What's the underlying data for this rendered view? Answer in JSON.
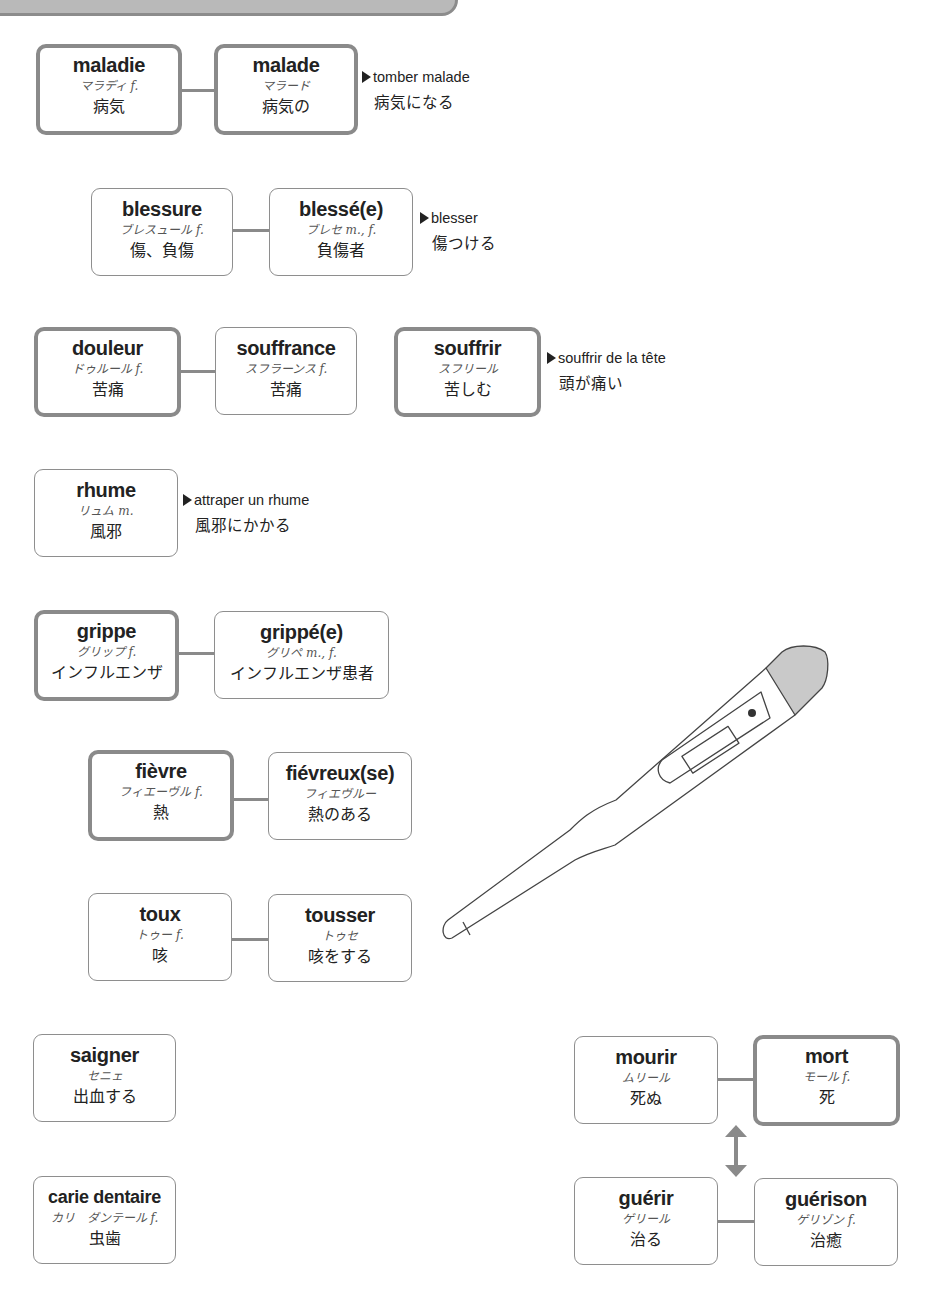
{
  "cards": {
    "maladie": {
      "fr": "maladie",
      "kana": "マラディ f.",
      "ja": "病気"
    },
    "malade": {
      "fr": "malade",
      "kana": "マラード",
      "ja": "病気の"
    },
    "blessure": {
      "fr": "blessure",
      "kana": "ブレスュール f.",
      "ja": "傷、負傷"
    },
    "blesse": {
      "fr": "blessé(e)",
      "kana": "ブレセ m., f.",
      "ja": "負傷者"
    },
    "douleur": {
      "fr": "douleur",
      "kana": "ドゥルール f.",
      "ja": "苦痛"
    },
    "souffrance": {
      "fr": "souffrance",
      "kana": "スフラーンス f.",
      "ja": "苦痛"
    },
    "souffrir": {
      "fr": "souffrir",
      "kana": "スフリール",
      "ja": "苦しむ"
    },
    "rhume": {
      "fr": "rhume",
      "kana": "リュム m.",
      "ja": "風邪"
    },
    "grippe": {
      "fr": "grippe",
      "kana": "グリップ f.",
      "ja": "インフルエンザ"
    },
    "grippe_e": {
      "fr": "grippé(e)",
      "kana": "グリペ m., f.",
      "ja": "インフルエンザ患者"
    },
    "fievre": {
      "fr": "fièvre",
      "kana": "フィエーヴル f.",
      "ja": "熱"
    },
    "fievreux": {
      "fr": "fiévreux(se)",
      "kana": "フィエヴルー",
      "ja": "熱のある"
    },
    "toux": {
      "fr": "toux",
      "kana": "トゥー f.",
      "ja": "咳"
    },
    "tousser": {
      "fr": "tousser",
      "kana": "トゥセ",
      "ja": "咳をする"
    },
    "saigner": {
      "fr": "saigner",
      "kana": "セニェ",
      "ja": "出血する"
    },
    "carie": {
      "fr": "carie dentaire",
      "kana": "カリ　ダンテール f.",
      "ja": "虫歯"
    },
    "mourir": {
      "fr": "mourir",
      "kana": "ムリール",
      "ja": "死ぬ"
    },
    "mort": {
      "fr": "mort",
      "kana": "モール f.",
      "ja": "死"
    },
    "guerir": {
      "fr": "guérir",
      "kana": "ゲリール",
      "ja": "治る"
    },
    "guerison": {
      "fr": "guérison",
      "kana": "ゲリゾン f.",
      "ja": "治癒"
    }
  },
  "notes": {
    "malade": {
      "fr": "tomber malade",
      "ja": "病気になる"
    },
    "blesse": {
      "fr": "blesser",
      "ja": "傷つける"
    },
    "souffrir": {
      "fr": "souffrir de la tête",
      "ja": "頭が痛い"
    },
    "rhume": {
      "fr": "attraper un rhume",
      "ja": "風邪にかかる"
    }
  },
  "illustration": {
    "icon": "thermometer-icon"
  },
  "colors": {
    "border": "#8a8a8a",
    "banner": "#b9b9b9",
    "text": "#222222"
  }
}
